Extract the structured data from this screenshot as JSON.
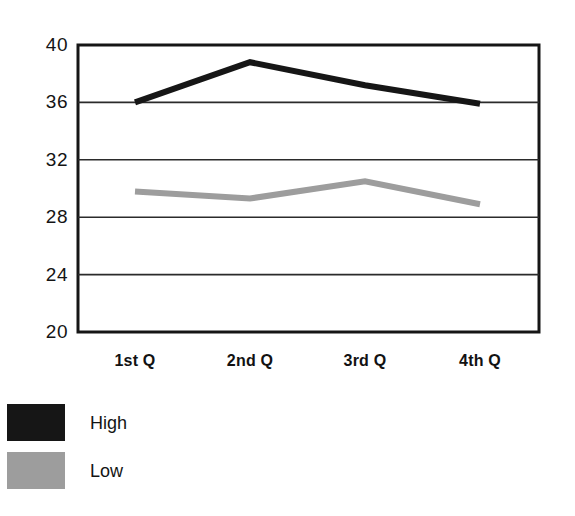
{
  "chart_data": {
    "type": "line",
    "title": "",
    "xlabel": "",
    "ylabel": "",
    "categories": [
      "1st Q",
      "2nd Q",
      "3rd Q",
      "4th Q"
    ],
    "series": [
      {
        "name": "High",
        "color": "#161616",
        "values": [
          36.0,
          38.8,
          37.2,
          35.9
        ]
      },
      {
        "name": "Low",
        "color": "#9d9d9d",
        "values": [
          29.8,
          29.3,
          30.5,
          28.9
        ]
      }
    ],
    "ylim": [
      20,
      40
    ],
    "yticks": [
      40,
      36,
      32,
      28,
      24,
      20
    ],
    "ytick_labels": [
      "40",
      "36",
      "32",
      "28",
      "24",
      "20"
    ],
    "grid": "horizontal",
    "legend_position": "bottom-left"
  },
  "axis": {
    "y_labels": [
      "40",
      "36",
      "32",
      "28",
      "24",
      "20"
    ],
    "x_labels": [
      "1st Q",
      "2nd Q",
      "3rd Q",
      "4th Q"
    ]
  },
  "legend": {
    "items": [
      {
        "label": "High",
        "color": "#161616"
      },
      {
        "label": "Low",
        "color": "#9d9d9d"
      }
    ]
  }
}
